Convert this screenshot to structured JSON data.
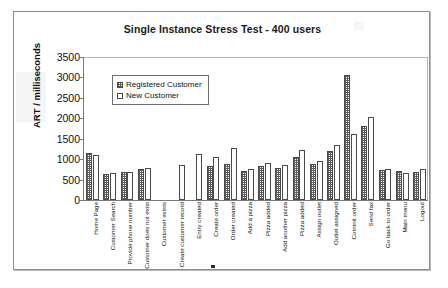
{
  "chart_data": {
    "type": "bar",
    "title": "Single Instance Stress Test - 400 users",
    "xlabel": "",
    "ylabel": "ART / milliseconds",
    "ylim": [
      0,
      3500
    ],
    "ytick_step": 500,
    "yticks": [
      "3500",
      "3000",
      "2500",
      "2000",
      "1500",
      "1000",
      "500",
      "0"
    ],
    "grid": false,
    "legend_position": "upper-left-inside",
    "categories": [
      "Home Page",
      "Customer Search",
      "Provide phone number",
      "Customer does not exist",
      "Customer exists",
      "Create customer record",
      "Entry created",
      "Create order",
      "Order created",
      "Add a pizza",
      "Pizza added",
      "Add another pizza",
      "Pizza added",
      "Assign outlet",
      "Outlet assigned",
      "Commit order",
      "Send fax",
      "Go back to order",
      "Main menu",
      "Logout"
    ],
    "series": [
      {
        "name": "Registered Customer",
        "fill": "hatched",
        "values": [
          1150,
          630,
          680,
          770,
          null,
          null,
          null,
          840,
          880,
          710,
          830,
          780,
          1060,
          890,
          1210,
          3060,
          1820,
          740,
          700,
          680
        ]
      },
      {
        "name": "New Customer",
        "fill": "white",
        "values": [
          1100,
          660,
          680,
          780,
          null,
          860,
          1130,
          1060,
          1280,
          770,
          910,
          860,
          1230,
          960,
          1340,
          1610,
          2030,
          750,
          660,
          760
        ]
      }
    ]
  },
  "legend": {
    "items": [
      {
        "label": "Registered Customer",
        "swatch": "hatched"
      },
      {
        "label": "New Customer",
        "swatch": "white"
      }
    ]
  },
  "colors": {
    "background": "#ffffff",
    "frame_border": "#8d8d8d",
    "axis": "#7a7a7a",
    "bar_outline": "#4a4a4a",
    "hatch": "#5d5d5d",
    "text": "#111111"
  }
}
